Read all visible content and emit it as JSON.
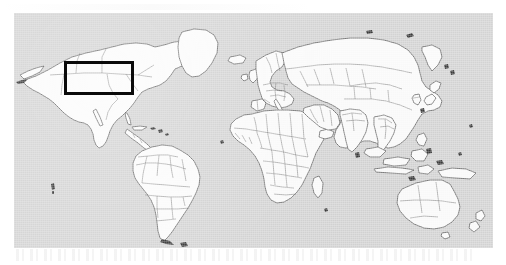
{
  "figure": {
    "kind": "world-map",
    "caption": "",
    "projection": "equirectangular"
  },
  "canvas": {
    "width_px": 506,
    "height_px": 265,
    "page_background": "#ffffff"
  },
  "map": {
    "ocean_color": "#d4d4d4",
    "land_color": "#fbfbfb",
    "coastline_color": "#4a4a4a",
    "country_border_color": "#6f6f6f",
    "plate": {
      "left_px": 14,
      "top_px": 13,
      "width_px": 479,
      "height_px": 235
    }
  },
  "highlight": {
    "shape": "rectangle",
    "label": "",
    "color": "#0a0a0a",
    "stroke_width_px": 3,
    "region_name": "Western United States",
    "left_px": 64,
    "top_px": 61,
    "width_px": 70,
    "height_px": 34
  },
  "landmasses": [
    {
      "name": "North America"
    },
    {
      "name": "South America"
    },
    {
      "name": "Greenland"
    },
    {
      "name": "Europe"
    },
    {
      "name": "Africa"
    },
    {
      "name": "Asia"
    },
    {
      "name": "Australia"
    },
    {
      "name": "New Zealand"
    },
    {
      "name": "Indonesia"
    },
    {
      "name": "Japan"
    },
    {
      "name": "Madagascar"
    },
    {
      "name": "Iceland"
    },
    {
      "name": "United Kingdom"
    },
    {
      "name": "Philippines"
    },
    {
      "name": "Caribbean Islands"
    }
  ],
  "artifacts": {
    "bottom_smudge_visible": true,
    "top_smudge_visible": true
  }
}
